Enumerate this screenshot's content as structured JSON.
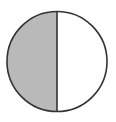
{
  "diagram": {
    "type": "fraction-circle",
    "parts_total": 2,
    "parts_shaded": 1,
    "shaded_side": "left",
    "colors": {
      "shaded_fill": "#b9b9b9",
      "unshaded_fill": "#ffffff",
      "stroke": "#333333",
      "background": "#ffffff"
    }
  }
}
